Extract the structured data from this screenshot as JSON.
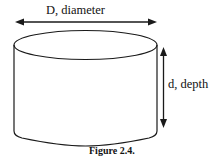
{
  "figure": {
    "caption": "Figure 2.4.",
    "shape": "cylinder",
    "labels": {
      "diameter": "D, diameter",
      "depth": "d, depth"
    },
    "colors": {
      "stroke": "#1a1a1a",
      "background": "#ffffff"
    }
  }
}
